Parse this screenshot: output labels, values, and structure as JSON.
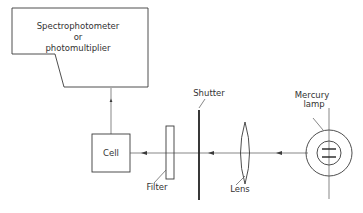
{
  "diagram": {
    "type": "optical-setup",
    "components": {
      "detector": {
        "line1": "Spectrophotometer",
        "line2": "or",
        "line3": "photomultiplier"
      },
      "cell": {
        "label": "Cell"
      },
      "filter": {
        "label": "Filter"
      },
      "shutter": {
        "label": "Shutter"
      },
      "lens": {
        "label": "Lens"
      },
      "lamp": {
        "line1": "Mercury",
        "line2": "lamp"
      }
    },
    "colors": {
      "line": "#3a3a3a",
      "text": "#333333",
      "background": "#ffffff"
    }
  }
}
